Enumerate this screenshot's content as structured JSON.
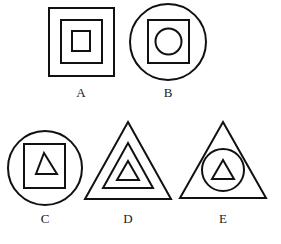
{
  "figures": [
    {
      "label": "A",
      "description": "three nested squares"
    },
    {
      "label": "B",
      "description": "circle containing square containing circle"
    },
    {
      "label": "C",
      "description": "circle containing square containing triangle"
    },
    {
      "label": "D",
      "description": "three nested triangles"
    },
    {
      "label": "E",
      "description": "triangle containing circle containing triangle"
    }
  ],
  "colors": {
    "stroke": "#111111",
    "background": "#ffffff"
  }
}
